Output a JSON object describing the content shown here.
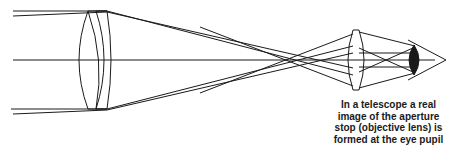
{
  "diagram": {
    "components": [
      {
        "id": "objective-lens",
        "label": "objective lens",
        "type": "doublet"
      },
      {
        "id": "eyepiece-lens",
        "label": "eyepiece",
        "type": "biconvex"
      },
      {
        "id": "eye",
        "label": "eye pupil",
        "type": "eye"
      }
    ],
    "colors": {
      "stroke": "#1a1a1a",
      "background": "#ffffff"
    }
  },
  "caption": {
    "lines": [
      "In a telescope a real",
      "image of the aperture",
      "stop (objective lens) is",
      "formed at the eye pupil"
    ]
  }
}
